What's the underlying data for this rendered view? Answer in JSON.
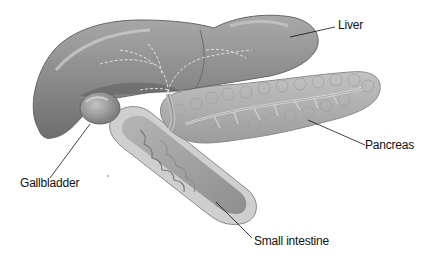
{
  "diagram": {
    "type": "anatomical-illustration",
    "labels": [
      {
        "id": "liver",
        "text": "Liver"
      },
      {
        "id": "pancreas",
        "text": "Pancreas"
      },
      {
        "id": "gallbladder",
        "text": "Gallbladder"
      },
      {
        "id": "small_intestine",
        "text": "Small intestine"
      }
    ],
    "colors": {
      "background": "#ffffff",
      "liver": "#8a8a8a",
      "liver_highlight": "#b8b8b8",
      "gallbladder": "#9a9a9a",
      "pancreas": "#b0b0b0",
      "intestine": "#a8a8a8",
      "intestine_wall": "#c8c8c8",
      "leader_line": "#111111"
    }
  }
}
